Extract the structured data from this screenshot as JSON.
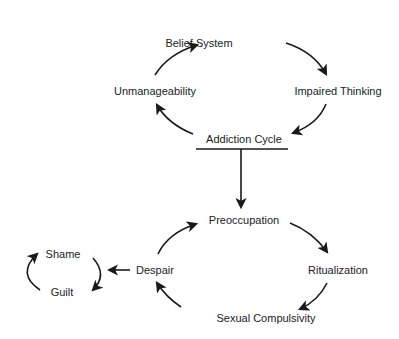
{
  "diagram": {
    "top_cycle": {
      "nodes": {
        "belief_system": "Belief System",
        "impaired_thinking": "Impaired Thinking",
        "addiction_cycle": "Addiction Cycle",
        "unmanageability": "Unmanageability"
      },
      "flow": [
        "Belief System",
        "Impaired Thinking",
        "Addiction Cycle",
        "Unmanageability",
        "Belief System"
      ]
    },
    "bottom_cycle": {
      "nodes": {
        "preoccupation": "Preoccupation",
        "ritualization": "Ritualization",
        "sexual_compulsivity": "Sexual Compulsivity",
        "despair": "Despair"
      },
      "flow": [
        "Preoccupation",
        "Ritualization",
        "Sexual Compulsivity",
        "Despair",
        "Preoccupation"
      ]
    },
    "side_cycle": {
      "nodes": {
        "shame": "Shame",
        "guilt": "Guilt"
      },
      "flow": [
        "Shame",
        "Guilt",
        "Shame"
      ]
    },
    "connections": [
      {
        "from": "Addiction Cycle",
        "to": "Preoccupation"
      },
      {
        "from": "Despair",
        "to": "Shame/Guilt cycle"
      }
    ],
    "colors": {
      "line": "#1a1a1a",
      "text": "#222222",
      "background": "#ffffff"
    }
  }
}
